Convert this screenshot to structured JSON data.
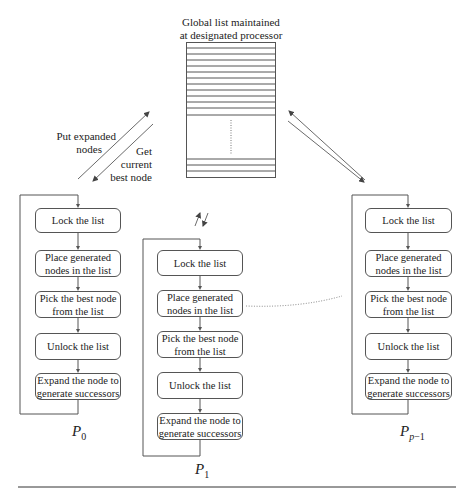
{
  "global_list": {
    "title_line1": "Global list maintained",
    "title_line2": "at designated processor"
  },
  "arrow_labels": {
    "put_line1": "Put expanded",
    "put_line2": "nodes",
    "get_line1": "Get",
    "get_line2": "current",
    "get_line3": "best node"
  },
  "processors": [
    {
      "name": "P",
      "subscript": "0",
      "steps": [
        {
          "line1": "Lock the list",
          "line2": ""
        },
        {
          "line1": "Place generated",
          "line2": "nodes in the list"
        },
        {
          "line1": "Pick the best node",
          "line2": "from the list"
        },
        {
          "line1": "Unlock the list",
          "line2": ""
        },
        {
          "line1": "Expand the node to",
          "line2": "generate successors"
        }
      ]
    },
    {
      "name": "P",
      "subscript": "1",
      "steps": [
        {
          "line1": "Lock the list",
          "line2": ""
        },
        {
          "line1": "Place generated",
          "line2": "nodes in the list"
        },
        {
          "line1": "Pick the best node",
          "line2": "from the list"
        },
        {
          "line1": "Unlock the list",
          "line2": ""
        },
        {
          "line1": "Expand the node to",
          "line2": "generate successors"
        }
      ]
    },
    {
      "name": "P",
      "subscript_var": "p",
      "subscript_rest": "−1",
      "steps": [
        {
          "line1": "Lock the list",
          "line2": ""
        },
        {
          "line1": "Place generated",
          "line2": "nodes in the list"
        },
        {
          "line1": "Pick the best node",
          "line2": "from the list"
        },
        {
          "line1": "Unlock the list",
          "line2": ""
        },
        {
          "line1": "Expand the node to",
          "line2": "generate successors"
        }
      ]
    }
  ]
}
